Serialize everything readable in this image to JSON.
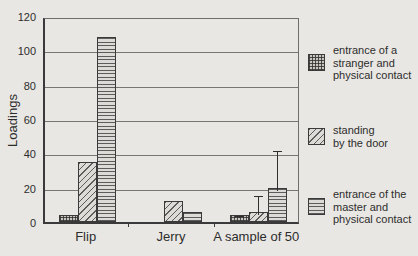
{
  "figure": {
    "background": "#e9e7e3",
    "axis_color": "#3a3a3a",
    "grid_color": "#767672"
  },
  "chart_data": {
    "type": "bar",
    "title": "",
    "xlabel": "",
    "ylabel": "Loadings",
    "ylim": [
      0,
      120
    ],
    "yticks": [
      0,
      20,
      40,
      60,
      80,
      100,
      120
    ],
    "grid": true,
    "legend_position": "right",
    "categories": [
      "Flip",
      "Jerry",
      "A sample of 50"
    ],
    "series": [
      {
        "name": "entrance of a stranger and physical contact",
        "pattern": "crosshatch",
        "values": [
          4,
          0,
          4
        ],
        "error_up": [
          null,
          null,
          1.5
        ]
      },
      {
        "name": "standing by the door",
        "pattern": "diagonal",
        "values": [
          35,
          12,
          6
        ],
        "error_up": [
          null,
          null,
          11
        ]
      },
      {
        "name": "entrance of the master and physical contact",
        "pattern": "horizontal",
        "values": [
          108,
          6,
          20
        ],
        "error_up": [
          null,
          null,
          23
        ]
      }
    ]
  },
  "legend": {
    "items": [
      {
        "pattern": "crosshatch",
        "lines": "entrance of a\nstranger and\nphysical contact"
      },
      {
        "pattern": "diagonal",
        "lines": "standing\nby the door"
      },
      {
        "pattern": "horizontal",
        "lines": "entrance of the\nmaster and\nphysical contact"
      }
    ]
  }
}
